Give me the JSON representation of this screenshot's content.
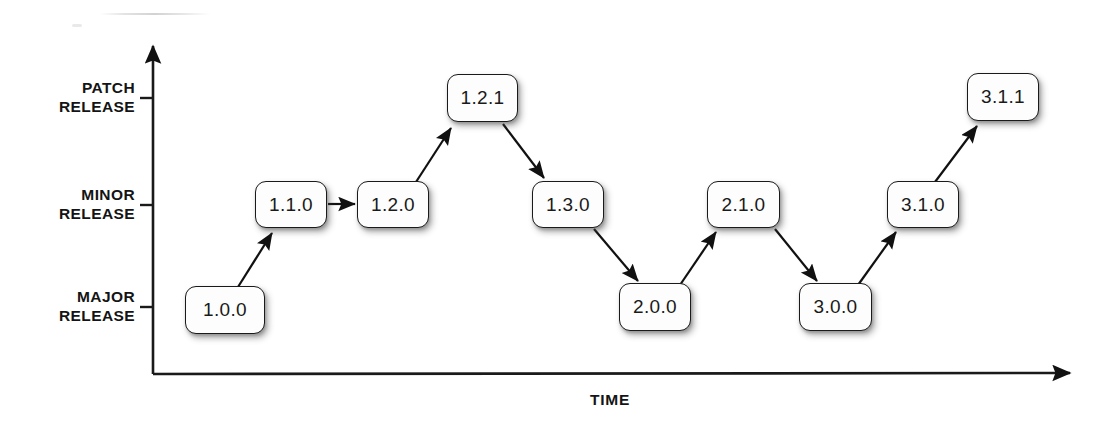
{
  "diagram": {
    "background_color": "#ffffff",
    "line_color": "#1a1a1a",
    "text_color": "#141414",
    "box_fill": "#fdfdfd"
  },
  "axes": {
    "y_axis": {
      "name": "release-level-axis",
      "ticks": [
        {
          "id": "patch",
          "label": "PATCH\nRELEASE",
          "y": 98
        },
        {
          "id": "minor",
          "label": "MINOR\nRELEASE",
          "y": 205
        },
        {
          "id": "major",
          "label": "MAJOR\nRELEASE",
          "y": 307
        }
      ]
    },
    "x_axis": {
      "name": "time-axis",
      "label": "TIME"
    }
  },
  "nodes": [
    {
      "id": "n1",
      "label": "1.0.0",
      "level": "major",
      "x": 185,
      "y": 286,
      "w": 80,
      "h": 48
    },
    {
      "id": "n2",
      "label": "1.1.0",
      "level": "minor",
      "x": 255,
      "y": 181,
      "w": 72,
      "h": 47
    },
    {
      "id": "n3",
      "label": "1.2.0",
      "level": "minor",
      "x": 357,
      "y": 181,
      "w": 72,
      "h": 47
    },
    {
      "id": "n4",
      "label": "1.2.1",
      "level": "patch",
      "x": 447,
      "y": 74,
      "w": 71,
      "h": 48
    },
    {
      "id": "n5",
      "label": "1.3.0",
      "level": "minor",
      "x": 532,
      "y": 181,
      "w": 72,
      "h": 47
    },
    {
      "id": "n6",
      "label": "2.0.0",
      "level": "major",
      "x": 619,
      "y": 283,
      "w": 72,
      "h": 48
    },
    {
      "id": "n7",
      "label": "2.1.0",
      "level": "minor",
      "x": 707,
      "y": 181,
      "w": 73,
      "h": 47
    },
    {
      "id": "n8",
      "label": "3.0.0",
      "level": "major",
      "x": 799,
      "y": 283,
      "w": 73,
      "h": 48
    },
    {
      "id": "n9",
      "label": "3.1.0",
      "level": "minor",
      "x": 887,
      "y": 181,
      "w": 72,
      "h": 47
    },
    {
      "id": "n10",
      "label": "3.1.1",
      "level": "patch",
      "x": 967,
      "y": 73,
      "w": 72,
      "h": 48
    }
  ],
  "edges": [
    {
      "id": "e1",
      "from": "1.0.0",
      "to": "1.1.0",
      "kind": "up"
    },
    {
      "id": "e2",
      "from": "1.1.0",
      "to": "1.2.0",
      "kind": "flat"
    },
    {
      "id": "e3",
      "from": "1.2.0",
      "to": "1.2.1",
      "kind": "up"
    },
    {
      "id": "e4",
      "from": "1.2.1",
      "to": "1.3.0",
      "kind": "down"
    },
    {
      "id": "e5",
      "from": "1.3.0",
      "to": "2.0.0",
      "kind": "down"
    },
    {
      "id": "e6",
      "from": "2.0.0",
      "to": "2.1.0",
      "kind": "up"
    },
    {
      "id": "e7",
      "from": "2.1.0",
      "to": "3.0.0",
      "kind": "down"
    },
    {
      "id": "e8",
      "from": "3.0.0",
      "to": "3.1.0",
      "kind": "up"
    },
    {
      "id": "e9",
      "from": "3.1.0",
      "to": "3.1.1",
      "kind": "up"
    }
  ]
}
